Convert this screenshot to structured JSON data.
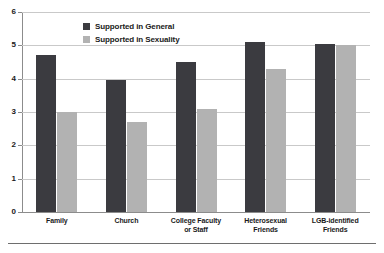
{
  "chart_data": {
    "type": "bar",
    "title": "",
    "xlabel": "",
    "ylabel": "",
    "ylim": [
      0,
      6
    ],
    "yticks": [
      "0",
      "1",
      "2",
      "3",
      "4",
      "5",
      "6"
    ],
    "grid": true,
    "legend_position": "upper-left-inside",
    "categories": [
      "Family",
      "Church",
      "College Faculty or Staff",
      "Heterosexual Friends",
      "LGB-identified Friends"
    ],
    "category_lines": [
      [
        "Family"
      ],
      [
        "Church"
      ],
      [
        "College Faculty",
        "or Staff"
      ],
      [
        "Heterosexual",
        "Friends"
      ],
      [
        "LGB-identified",
        "Friends"
      ]
    ],
    "series": [
      {
        "name": "Supported in General",
        "color": "#3b3b40",
        "values": [
          4.7,
          3.95,
          4.5,
          5.1,
          5.05
        ]
      },
      {
        "name": "Supported in Sexuality",
        "color": "#b2b2b2",
        "values": [
          3.0,
          2.7,
          3.1,
          4.3,
          5.0
        ]
      }
    ]
  },
  "colors": {
    "series_general": "#3b3b40",
    "series_sexuality": "#b2b2b2",
    "gridline": "#c9c9c9",
    "axis": "#8c8c8c",
    "text": "#1a1a1a",
    "background": "#ffffff"
  }
}
